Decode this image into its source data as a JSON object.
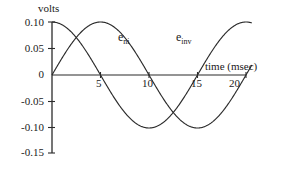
{
  "figure": {
    "y_axis_title": "volts",
    "x_axis_title": "time  (msec)"
  },
  "chart_data": {
    "type": "line",
    "title": "",
    "xlabel": "time  (msec)",
    "ylabel": "volts",
    "xlim": [
      0,
      21
    ],
    "ylim": [
      -0.15,
      0.1
    ],
    "grid": false,
    "legend": "inline-annotations",
    "xticks": [
      "5",
      "10",
      "15",
      "20"
    ],
    "xtick_values": [
      5,
      10,
      15,
      20
    ],
    "yticks": [
      "0.10",
      "0.05",
      "0",
      "-0.05",
      "-0.10",
      "-0.15"
    ],
    "ytick_values": [
      0.1,
      0.05,
      0,
      -0.05,
      -0.1,
      -0.15
    ],
    "amplitude": 0.1,
    "period_msec": 20,
    "series": [
      {
        "name": "e_ni",
        "label_text": "e",
        "label_sub": "ni",
        "form": "0.10*cos(2*pi*t/20)",
        "phase_deg": 0,
        "values_at_ticks": [
          0.1,
          0.0,
          -0.1,
          0.0,
          0.1
        ],
        "t_at_ticks": [
          0,
          5,
          10,
          15,
          20
        ]
      },
      {
        "name": "e_inv",
        "label_text": "e",
        "label_sub": "inv",
        "form": "0.10*sin(2*pi*t/20)",
        "phase_deg": -90,
        "values_at_ticks": [
          0.0,
          0.1,
          0.0,
          -0.1,
          0.1
        ],
        "t_at_ticks": [
          0,
          5,
          10,
          15,
          20
        ]
      }
    ]
  },
  "ytick_labels": [
    "0.10",
    "0.05",
    "0",
    "-0.05",
    "-0.10",
    "-0.15"
  ],
  "xtick_labels": [
    "5",
    "10",
    "15",
    "20"
  ],
  "curve_labels": {
    "ni_base": "e",
    "ni_sub": "ni",
    "inv_base": "e",
    "inv_sub": "inv"
  }
}
